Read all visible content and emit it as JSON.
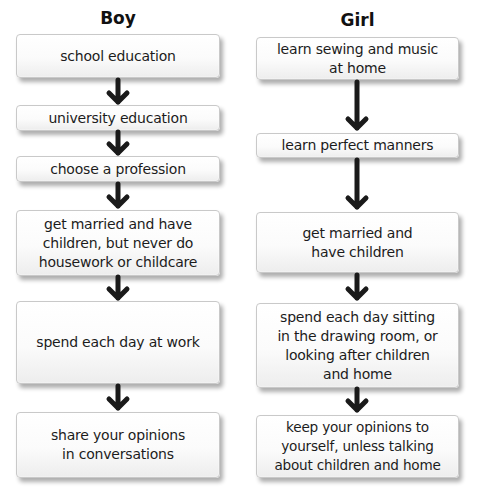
{
  "colors": {
    "text": "#1c1c1c",
    "arrow": "#1a1a1a",
    "box_border": "#c9c9c9",
    "background": "#ffffff"
  },
  "columns": [
    {
      "heading": "Boy",
      "steps": [
        {
          "label": "school education"
        },
        {
          "label": "university education"
        },
        {
          "label": "choose a profession"
        },
        {
          "label": "get married and have children, but never do housework or childcare"
        },
        {
          "label": "spend each day at work"
        },
        {
          "label": "share your opinions in conversations"
        }
      ]
    },
    {
      "heading": "Girl",
      "steps": [
        {
          "label": "learn sewing and music at home"
        },
        {
          "label": "learn perfect manners"
        },
        {
          "label": "get married and have children"
        },
        {
          "label": "spend each day sitting in the drawing room, or looking after children and home"
        },
        {
          "label": "keep your opinions to yourself, unless talking about children and home"
        }
      ]
    }
  ]
}
